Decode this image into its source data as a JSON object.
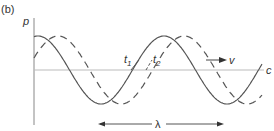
{
  "figure": {
    "panel_label": "(b)",
    "y_axis_label": "p",
    "x_axis_end_label": "c",
    "time_labels": {
      "t1": "t",
      "t1_sub": "1",
      "t2": "t",
      "t2_sub": "2"
    },
    "velocity_label": "v",
    "wavelength_label": "λ",
    "waves": [
      {
        "name": "wave-at-t1",
        "style": "solid",
        "phase_shift_fraction": 0.0
      },
      {
        "name": "wave-at-t2",
        "style": "dashed",
        "phase_shift_fraction": 0.16
      }
    ],
    "colors": {
      "line": "#555555",
      "axis": "#aaaaaa",
      "text": "#333333"
    }
  }
}
